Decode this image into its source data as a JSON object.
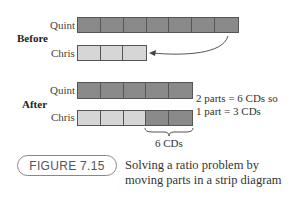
{
  "figure": {
    "number": "FIGURE 7.15",
    "caption": "Solving a ratio problem by moving parts in a strip diagram"
  },
  "before": {
    "section_label": "Before",
    "rows": [
      {
        "name": "Quint",
        "cells": [
          "dark",
          "dark",
          "dark",
          "dark",
          "dark",
          "dark",
          "dark"
        ]
      },
      {
        "name": "Chris",
        "cells": [
          "light",
          "light",
          "light"
        ]
      }
    ],
    "arrow": "move one part from Quint to Chris"
  },
  "after": {
    "section_label": "After",
    "rows": [
      {
        "name": "Quint",
        "cells": [
          "dark",
          "dark",
          "dark",
          "dark",
          "dark"
        ]
      },
      {
        "name": "Chris",
        "cells": [
          "light",
          "light",
          "light",
          "dark",
          "dark"
        ]
      }
    ],
    "brace_label": "6 CDs",
    "note_line1": "2 parts = 6 CDs so",
    "note_line2": "1 part = 3 CDs"
  },
  "colors": {
    "dark_cell": "#8a8a8a",
    "light_cell": "#d6d6d6"
  }
}
